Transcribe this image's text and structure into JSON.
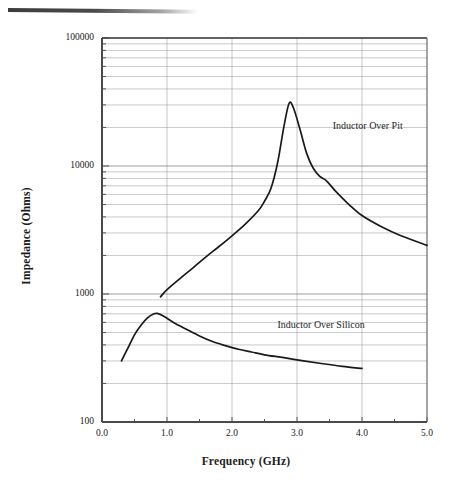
{
  "figure": {
    "background": "#ffffff",
    "line_color": "#1a1a1a",
    "grid_color": "#8d8d8d",
    "axis_color": "#555555"
  },
  "chart_data": {
    "type": "line",
    "title": "",
    "xlabel": "Frequency  (GHz)",
    "ylabel": "Impedance  (Ohms)",
    "xlim": [
      0.0,
      5.0
    ],
    "ylim": [
      100,
      100000
    ],
    "yscale": "log",
    "xscale": "linear",
    "grid": true,
    "grid_minor": true,
    "legend_position": "inline-annotation",
    "xticks": [
      "0.0",
      "1.0",
      "2.0",
      "3.0",
      "4.0",
      "5.0"
    ],
    "xtick_values": [
      0.0,
      1.0,
      2.0,
      3.0,
      4.0,
      5.0
    ],
    "yticks": [
      "100",
      "1000",
      "10000",
      "100000"
    ],
    "ytick_values": [
      100,
      1000,
      10000,
      100000
    ],
    "series": [
      {
        "name": "Inductor Over Pit",
        "label_x": 3.55,
        "label_y": 20000,
        "x": [
          0.9,
          1.0,
          1.2,
          1.4,
          1.6,
          1.8,
          2.0,
          2.2,
          2.4,
          2.5,
          2.6,
          2.7,
          2.8,
          2.88,
          2.95,
          3.05,
          3.15,
          3.25,
          3.35,
          3.45,
          3.6,
          3.8,
          4.0,
          4.3,
          4.6,
          5.0
        ],
        "y": [
          950,
          1080,
          1320,
          1600,
          1950,
          2350,
          2850,
          3500,
          4450,
          5300,
          6700,
          10500,
          20500,
          31000,
          28000,
          19000,
          12500,
          9600,
          8300,
          7700,
          6300,
          5000,
          4100,
          3350,
          2850,
          2400
        ]
      },
      {
        "name": "Inductor Over Silicon",
        "label_x": 2.7,
        "label_y": 560,
        "x": [
          0.3,
          0.4,
          0.5,
          0.6,
          0.7,
          0.8,
          0.85,
          0.95,
          1.1,
          1.3,
          1.5,
          1.7,
          1.9,
          2.1,
          2.3,
          2.5,
          2.8,
          3.1,
          3.4,
          3.7,
          4.0
        ],
        "y": [
          300,
          380,
          480,
          570,
          650,
          700,
          705,
          670,
          600,
          530,
          470,
          425,
          395,
          370,
          352,
          335,
          318,
          300,
          285,
          272,
          262
        ]
      }
    ]
  },
  "annotations": [
    {
      "name": "pit-curve-label",
      "text": "Inductor Over Pit"
    },
    {
      "name": "silicon-curve-label",
      "text": "Inductor Over Silicon"
    }
  ]
}
